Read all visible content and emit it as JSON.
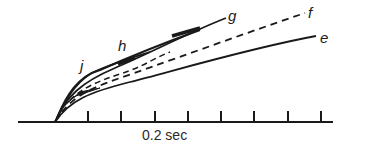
{
  "figure": {
    "type": "diagram",
    "axis": {
      "scale_label": "0.2 sec",
      "tick_count": 8
    },
    "curves": [
      {
        "id": "e",
        "label": "e",
        "style": "solid"
      },
      {
        "id": "f",
        "label": "f",
        "style": "dashed"
      },
      {
        "id": "g",
        "label": "g",
        "style": "solid"
      },
      {
        "id": "h",
        "label": "h",
        "style": "solid"
      },
      {
        "id": "j",
        "label": "j",
        "style": "solid"
      }
    ],
    "colors": {
      "ink": "#1a1a1a",
      "background": "#ffffff"
    }
  }
}
